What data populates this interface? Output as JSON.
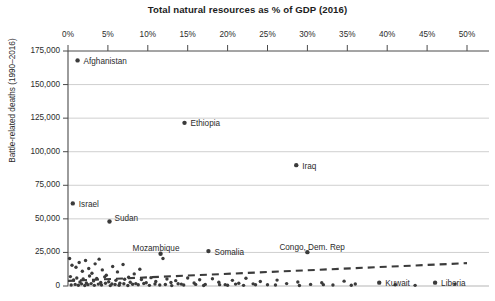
{
  "chart_data": {
    "type": "scatter",
    "title": "Total natural resources as % of GDP (2016)",
    "xlabel": "Total natural resources as % of GDP (2016)",
    "ylabel": "Battle-related deaths (1990–2016)",
    "xlim": [
      0,
      50
    ],
    "ylim": [
      0,
      175000
    ],
    "grid": true,
    "legend": "none",
    "x_ticks": [
      "0%",
      "5%",
      "10%",
      "15%",
      "20%",
      "25%",
      "30%",
      "35%",
      "40%",
      "45%",
      "50%"
    ],
    "x_tick_values": [
      0,
      5,
      10,
      15,
      20,
      25,
      30,
      35,
      40,
      45,
      50
    ],
    "y_ticks": [
      "0",
      "25,000",
      "50,000",
      "75,000",
      "100,000",
      "125,000",
      "150,000",
      "175,000"
    ],
    "y_tick_values": [
      0,
      25000,
      50000,
      75000,
      100000,
      125000,
      150000,
      175000
    ],
    "labeled_points": [
      {
        "label": "Afghanistan",
        "x": 1.2,
        "y": 168000,
        "label_dx": 6,
        "label_dy": -3.5
      },
      {
        "label": "Ethiopia",
        "x": 14.6,
        "y": 121500,
        "label_dx": 6,
        "label_dy": -3.5
      },
      {
        "label": "Iraq",
        "x": 28.6,
        "y": 90000,
        "label_dx": 6,
        "label_dy": -3.5
      },
      {
        "label": "Israel",
        "x": 0.6,
        "y": 61500,
        "label_dx": 6,
        "label_dy": -3.5
      },
      {
        "label": "Sudan",
        "x": 5.2,
        "y": 48000,
        "label_dx": 5,
        "label_dy": -7.5
      },
      {
        "label": "Mozambique",
        "x": 11.6,
        "y": 24000,
        "label_dx": -28,
        "label_dy": -9.5
      },
      {
        "label": "Somalia",
        "x": 17.6,
        "y": 26000,
        "label_dx": 6,
        "label_dy": -3.5
      },
      {
        "label": "Congo, Dem. Rep",
        "x": 30.0,
        "y": 25200,
        "label_dx": -28,
        "label_dy": -9.5
      },
      {
        "label": "Kuwait",
        "x": 39.0,
        "y": 2500,
        "label_dx": 6,
        "label_dy": -3.5
      },
      {
        "label": "Liberia",
        "x": 46.0,
        "y": 2500,
        "label_dx": 6,
        "label_dy": -3.5
      }
    ],
    "unlabeled_points": [
      {
        "x": 0.2,
        "y": 20500
      },
      {
        "x": 0.5,
        "y": 15500
      },
      {
        "x": 1.0,
        "y": 14000
      },
      {
        "x": 1.4,
        "y": 17500
      },
      {
        "x": 1.8,
        "y": 11000
      },
      {
        "x": 2.2,
        "y": 19000
      },
      {
        "x": 2.6,
        "y": 13000
      },
      {
        "x": 3.0,
        "y": 9500
      },
      {
        "x": 3.4,
        "y": 16500
      },
      {
        "x": 3.9,
        "y": 20000
      },
      {
        "x": 4.3,
        "y": 12000
      },
      {
        "x": 4.8,
        "y": 8000
      },
      {
        "x": 5.6,
        "y": 14500
      },
      {
        "x": 6.2,
        "y": 10500
      },
      {
        "x": 6.9,
        "y": 16000
      },
      {
        "x": 7.6,
        "y": 6500
      },
      {
        "x": 8.3,
        "y": 9000
      },
      {
        "x": 9.0,
        "y": 12500
      },
      {
        "x": 0.3,
        "y": 7000
      },
      {
        "x": 0.7,
        "y": 4500
      },
      {
        "x": 1.1,
        "y": 6000
      },
      {
        "x": 1.5,
        "y": 3000
      },
      {
        "x": 1.9,
        "y": 5200
      },
      {
        "x": 2.3,
        "y": 2200
      },
      {
        "x": 2.7,
        "y": 7500
      },
      {
        "x": 3.2,
        "y": 3800
      },
      {
        "x": 3.6,
        "y": 5600
      },
      {
        "x": 4.1,
        "y": 2600
      },
      {
        "x": 4.6,
        "y": 6800
      },
      {
        "x": 5.1,
        "y": 3200
      },
      {
        "x": 5.5,
        "y": 1500
      },
      {
        "x": 6.0,
        "y": 4200
      },
      {
        "x": 6.5,
        "y": 2000
      },
      {
        "x": 7.1,
        "y": 5000
      },
      {
        "x": 7.8,
        "y": 2800
      },
      {
        "x": 8.5,
        "y": 1800
      },
      {
        "x": 9.2,
        "y": 4800
      },
      {
        "x": 9.8,
        "y": 2400
      },
      {
        "x": 10.4,
        "y": 6200
      },
      {
        "x": 11.0,
        "y": 3400
      },
      {
        "x": 11.9,
        "y": 20500
      },
      {
        "x": 12.4,
        "y": 5200
      },
      {
        "x": 12.9,
        "y": 2600
      },
      {
        "x": 13.5,
        "y": 4000
      },
      {
        "x": 14.2,
        "y": 1400
      },
      {
        "x": 15.0,
        "y": 6000
      },
      {
        "x": 15.8,
        "y": 2200
      },
      {
        "x": 16.5,
        "y": 4600
      },
      {
        "x": 17.2,
        "y": 1200
      },
      {
        "x": 18.1,
        "y": 5400
      },
      {
        "x": 18.9,
        "y": 2800
      },
      {
        "x": 19.7,
        "y": 1000
      },
      {
        "x": 20.6,
        "y": 4200
      },
      {
        "x": 21.4,
        "y": 2000
      },
      {
        "x": 22.3,
        "y": 5800
      },
      {
        "x": 23.2,
        "y": 1600
      },
      {
        "x": 24.1,
        "y": 3400
      },
      {
        "x": 25.0,
        "y": 900
      },
      {
        "x": 26.2,
        "y": 4400
      },
      {
        "x": 27.4,
        "y": 1800
      },
      {
        "x": 28.8,
        "y": 3000
      },
      {
        "x": 30.4,
        "y": 1200
      },
      {
        "x": 31.8,
        "y": 2400
      },
      {
        "x": 33.2,
        "y": 800
      },
      {
        "x": 34.6,
        "y": 3600
      },
      {
        "x": 36.0,
        "y": 1500
      },
      {
        "x": 0.4,
        "y": 800
      },
      {
        "x": 0.9,
        "y": 1200
      },
      {
        "x": 1.3,
        "y": 600
      },
      {
        "x": 1.7,
        "y": 1600
      },
      {
        "x": 2.1,
        "y": 400
      },
      {
        "x": 2.5,
        "y": 1000
      },
      {
        "x": 2.9,
        "y": 1800
      },
      {
        "x": 3.3,
        "y": 500
      },
      {
        "x": 3.8,
        "y": 1400
      },
      {
        "x": 4.2,
        "y": 700
      },
      {
        "x": 4.7,
        "y": 2000
      },
      {
        "x": 5.3,
        "y": 300
      },
      {
        "x": 5.9,
        "y": 1100
      },
      {
        "x": 6.4,
        "y": 600
      },
      {
        "x": 7.0,
        "y": 1700
      },
      {
        "x": 7.5,
        "y": 400
      },
      {
        "x": 8.1,
        "y": 1300
      },
      {
        "x": 8.8,
        "y": 900
      },
      {
        "x": 9.5,
        "y": 1900
      },
      {
        "x": 10.2,
        "y": 500
      },
      {
        "x": 10.9,
        "y": 1500
      },
      {
        "x": 11.5,
        "y": 700
      },
      {
        "x": 12.2,
        "y": 1100
      },
      {
        "x": 13.0,
        "y": 300
      },
      {
        "x": 13.8,
        "y": 1700
      },
      {
        "x": 14.5,
        "y": 800
      },
      {
        "x": 16.0,
        "y": 1200
      },
      {
        "x": 17.0,
        "y": 400
      },
      {
        "x": 19.0,
        "y": 1000
      },
      {
        "x": 20.0,
        "y": 600
      },
      {
        "x": 21.0,
        "y": 1400
      },
      {
        "x": 22.0,
        "y": 500
      },
      {
        "x": 23.5,
        "y": 900
      },
      {
        "x": 26.0,
        "y": 700
      },
      {
        "x": 29.0,
        "y": 400
      },
      {
        "x": 32.0,
        "y": 1000
      },
      {
        "x": 35.5,
        "y": 600
      },
      {
        "x": 41.0,
        "y": 900
      },
      {
        "x": 43.5,
        "y": 500
      },
      {
        "x": 48.5,
        "y": 1400
      }
    ],
    "trendline": {
      "style": "dashed",
      "x_start": 0,
      "y_start": 3800,
      "x_end": 50,
      "y_end": 17000
    }
  },
  "colors": {
    "point": "#3b3b3b",
    "grid": "#c9c9c9",
    "axis": "#4a4a4a",
    "text": "#2b2b2b",
    "trendline": "#3b3b3b"
  }
}
